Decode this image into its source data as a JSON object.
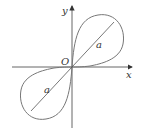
{
  "diagram": {
    "type": "lemniscate",
    "axes": {
      "x_label": "x",
      "y_label": "y",
      "origin_label": "O"
    },
    "segment_labels": [
      "a",
      "a"
    ],
    "colors": {
      "curve": "#666666",
      "axis": "#444444",
      "text": "#333333"
    }
  }
}
